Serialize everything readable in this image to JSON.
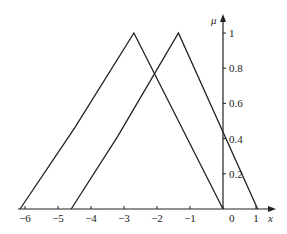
{
  "chart_data": {
    "type": "line",
    "title": "",
    "xlabel": "x",
    "ylabel": "μ",
    "xlim": [
      -6.2,
      1.3
    ],
    "ylim": [
      0,
      1.05
    ],
    "x_ticks": [
      "-6",
      "-5",
      "-4",
      "-3",
      "-2",
      "-1",
      "0",
      "1"
    ],
    "y_ticks": [
      "0.2",
      "0.4",
      "0.6",
      "0.8",
      "1"
    ],
    "grid": false,
    "legend": null,
    "series": [
      {
        "name": "membership-1",
        "points": [
          [
            -6.15,
            0
          ],
          [
            -4.5,
            0.46
          ],
          [
            -2.7,
            1
          ],
          [
            0,
            0
          ]
        ]
      },
      {
        "name": "membership-2",
        "points": [
          [
            -4.6,
            0
          ],
          [
            -3.2,
            0.41
          ],
          [
            -1.35,
            1
          ],
          [
            1.05,
            0
          ]
        ]
      }
    ]
  },
  "axis_labels": {
    "x": "x",
    "y": "μ",
    "origin": "0"
  }
}
